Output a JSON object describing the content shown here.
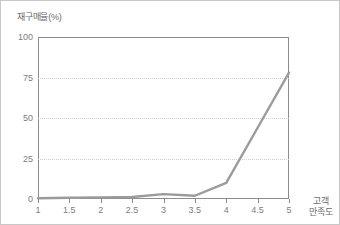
{
  "chart_data": {
    "type": "line",
    "title": "",
    "xlabel": "고객 만족도",
    "xlabel_lines": [
      "고객",
      "만족도"
    ],
    "ylabel": "재구매율(%)",
    "x": [
      1,
      1.5,
      2,
      2.5,
      3,
      3.5,
      4,
      4.5,
      5
    ],
    "categories": [
      "1",
      "1.5",
      "2",
      "2.5",
      "3",
      "3.5",
      "4",
      "4.5",
      "5"
    ],
    "values": [
      0.5,
      0.8,
      1.0,
      1.2,
      3.0,
      2.0,
      10.0,
      44.0,
      78.0
    ],
    "series": [
      {
        "name": "재구매율",
        "color": "#9b9b9b",
        "values": [
          0.5,
          0.8,
          1.0,
          1.2,
          3.0,
          2.0,
          10.0,
          44.0,
          78.0
        ]
      }
    ],
    "xlim": [
      1,
      5
    ],
    "ylim": [
      0,
      100
    ],
    "xticks": [
      1,
      1.5,
      2,
      2.5,
      3,
      3.5,
      4,
      4.5,
      5
    ],
    "yticks": [
      0,
      25,
      50,
      75,
      100
    ],
    "ytick_labels": [
      "0",
      "25",
      "50",
      "75",
      "100"
    ],
    "grid": "horizontal-dotted",
    "legend": "none",
    "colors": {
      "line": "#9b9b9b",
      "axis": "#8c8c8c",
      "grid": "#cfcfcf",
      "text": "#7d7d7d",
      "background": "#ffffff",
      "border": "#c8c8c8"
    }
  }
}
